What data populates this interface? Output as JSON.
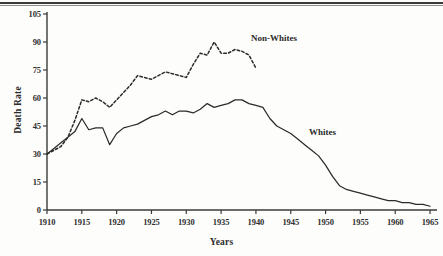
{
  "figure": {
    "y_axis_title": "Death Rate",
    "x_axis_title": "Years",
    "top_rule": "page-rule"
  },
  "chart_data": {
    "type": "line",
    "title": "",
    "xlabel": "Years",
    "ylabel": "Death Rate",
    "xlim": [
      1910,
      1966
    ],
    "ylim": [
      0,
      105
    ],
    "grid": false,
    "legend_position": "inline-annotations",
    "xticks": [
      1910,
      1915,
      1920,
      1925,
      1930,
      1935,
      1940,
      1945,
      1950,
      1955,
      1960,
      1965
    ],
    "yticks": [
      0,
      15,
      30,
      45,
      60,
      75,
      90,
      105
    ],
    "series": [
      {
        "name": "Non-Whites",
        "style": "dashed",
        "color": "#2b2b2b",
        "x": [
          1910,
          1911,
          1912,
          1913,
          1914,
          1915,
          1916,
          1917,
          1918,
          1919,
          1920,
          1921,
          1922,
          1923,
          1924,
          1925,
          1926,
          1927,
          1928,
          1929,
          1930,
          1931,
          1932,
          1933,
          1934,
          1935,
          1936,
          1937,
          1938,
          1939,
          1940
        ],
        "values": [
          30,
          32,
          34,
          39,
          48,
          59,
          58,
          60,
          58,
          55,
          59,
          63,
          67,
          72,
          71,
          70,
          72,
          74,
          73,
          72,
          71,
          78,
          84,
          83,
          90,
          84,
          84,
          86,
          85,
          83,
          76
        ]
      },
      {
        "name": "Whites",
        "style": "solid",
        "color": "#2b2b2b",
        "x": [
          1910,
          1911,
          1912,
          1913,
          1914,
          1915,
          1916,
          1917,
          1918,
          1919,
          1920,
          1921,
          1922,
          1923,
          1924,
          1925,
          1926,
          1927,
          1928,
          1929,
          1930,
          1931,
          1932,
          1933,
          1934,
          1935,
          1936,
          1937,
          1938,
          1939,
          1940,
          1941,
          1942,
          1943,
          1944,
          1945,
          1946,
          1947,
          1948,
          1949,
          1950,
          1951,
          1952,
          1953,
          1954,
          1955,
          1956,
          1957,
          1958,
          1959,
          1960,
          1961,
          1962,
          1963,
          1964,
          1965
        ],
        "values": [
          30,
          33,
          36,
          39,
          42,
          49,
          43,
          44,
          44,
          35,
          41,
          44,
          45,
          46,
          48,
          50,
          51,
          53,
          51,
          53,
          53,
          52,
          54,
          57,
          55,
          56,
          57,
          59,
          59,
          57,
          56,
          55,
          49,
          45,
          43,
          41,
          38,
          35,
          32,
          29,
          24,
          18,
          13,
          11,
          10,
          9,
          8,
          7,
          6,
          5,
          5,
          4,
          4,
          3,
          3,
          2
        ]
      }
    ],
    "annotations": [
      {
        "text": "Non-Whites",
        "x": 1943,
        "y": 93
      },
      {
        "text": "Whites",
        "x": 1952,
        "y": 42
      }
    ]
  }
}
